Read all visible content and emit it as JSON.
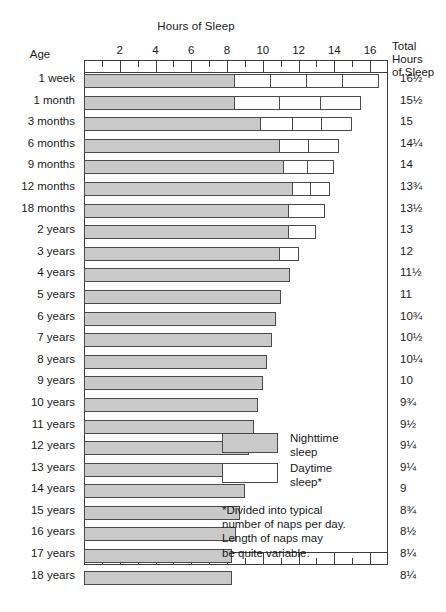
{
  "chart_data": {
    "type": "bar",
    "title": "Hours of Sleep",
    "subtitle": "",
    "xlabel": "Hours of Sleep",
    "ylabel": "Age",
    "orientation": "horizontal",
    "stacked": true,
    "xlim": [
      0,
      17
    ],
    "xticks_labeled": [
      2,
      4,
      6,
      8,
      10,
      12,
      14,
      16
    ],
    "xtick_labels": [
      "2",
      "4",
      "6",
      "8",
      "10",
      "12",
      "14",
      "16"
    ],
    "xticks_minor_step": 1,
    "bottom_xtick_labels": [
      "2",
      "4",
      "6",
      "8"
    ],
    "grid": false,
    "legend_position": "inside-lower-right",
    "series": [
      {
        "name": "Nighttime sleep",
        "color": "#c9c9c9"
      },
      {
        "name": "Daytime sleep*",
        "color": "#ffffff"
      }
    ],
    "categories": [
      "1 week",
      "1 month",
      "3 months",
      "6 months",
      "9 months",
      "12 months",
      "18 months",
      "2 years",
      "3 years",
      "4 years",
      "5 years",
      "6 years",
      "7 years",
      "8 years",
      "9 years",
      "10 years",
      "11 years",
      "12 years",
      "13 years",
      "14 years",
      "15 years",
      "16 years",
      "17 years",
      "18 years"
    ],
    "totals": [
      "16½",
      "15½",
      "15",
      "14¼",
      "14",
      "13¾",
      "13½",
      "13",
      "12",
      "11½",
      "11",
      "10¾",
      "10½",
      "10¼",
      "10",
      "9¾",
      "9½",
      "9¼",
      "9¼",
      "9",
      "8¾",
      "8½",
      "8¼",
      "8¼"
    ],
    "totals_numeric": [
      16.5,
      15.5,
      15,
      14.25,
      14,
      13.75,
      13.5,
      13,
      12,
      11.5,
      11,
      10.75,
      10.5,
      10.25,
      10,
      9.75,
      9.5,
      9.25,
      9.25,
      9,
      8.75,
      8.5,
      8.25,
      8.25
    ],
    "rows": [
      {
        "age": "1 week",
        "night": 8.5,
        "naps": [
          2.0,
          2.0,
          2.0,
          2.0
        ],
        "total": "16½"
      },
      {
        "age": "1 month",
        "night": 8.5,
        "naps": [
          2.5,
          2.25,
          2.25
        ],
        "total": "15½"
      },
      {
        "age": "3 months",
        "night": 10.0,
        "naps": [
          1.75,
          1.6,
          1.65
        ],
        "total": "15"
      },
      {
        "age": "6 months",
        "night": 11.0,
        "naps": [
          1.6,
          1.65
        ],
        "total": "14¼"
      },
      {
        "age": "9 months",
        "night": 11.25,
        "naps": [
          1.3,
          1.45
        ],
        "total": "14"
      },
      {
        "age": "12 months",
        "night": 11.75,
        "naps": [
          1.0,
          1.0
        ],
        "total": "13¾"
      },
      {
        "age": "18 months",
        "night": 11.5,
        "naps": [
          2.0
        ],
        "total": "13½"
      },
      {
        "age": "2 years",
        "night": 11.5,
        "naps": [
          1.5
        ],
        "total": "13"
      },
      {
        "age": "3 years",
        "night": 11.0,
        "naps": [
          1.0
        ],
        "total": "12"
      },
      {
        "age": "4 years",
        "night": 11.5,
        "naps": [],
        "total": "11½"
      },
      {
        "age": "5 years",
        "night": 11.0,
        "naps": [],
        "total": "11"
      },
      {
        "age": "6 years",
        "night": 10.75,
        "naps": [],
        "total": "10¾"
      },
      {
        "age": "7 years",
        "night": 10.5,
        "naps": [],
        "total": "10½"
      },
      {
        "age": "8 years",
        "night": 10.25,
        "naps": [],
        "total": "10¼"
      },
      {
        "age": "9 years",
        "night": 10.0,
        "naps": [],
        "total": "10"
      },
      {
        "age": "10 years",
        "night": 9.75,
        "naps": [],
        "total": "9¾"
      },
      {
        "age": "11 years",
        "night": 9.5,
        "naps": [],
        "total": "9½"
      },
      {
        "age": "12 years",
        "night": 9.25,
        "naps": [],
        "total": "9¼"
      },
      {
        "age": "13 years",
        "night": 9.25,
        "naps": [],
        "total": "9¼"
      },
      {
        "age": "14 years",
        "night": 9.0,
        "naps": [],
        "total": "9"
      },
      {
        "age": "15 years",
        "night": 8.75,
        "naps": [],
        "total": "8¾"
      },
      {
        "age": "16 years",
        "night": 8.5,
        "naps": [],
        "total": "8½"
      },
      {
        "age": "17 years",
        "night": 8.25,
        "naps": [],
        "total": "8¼"
      },
      {
        "age": "18 years",
        "night": 8.25,
        "naps": [],
        "total": "8¼"
      }
    ]
  },
  "headers": {
    "title": "Hours of Sleep",
    "age_label": "Age",
    "total_line1": "Total Hours",
    "total_line2": "of Sleep"
  },
  "legend": {
    "night_line1": "Nighttime",
    "night_line2": "sleep",
    "day_line1": "Daytime",
    "day_line2": "sleep*"
  },
  "footnote": {
    "line1": "*Divided into typical",
    "line2": "number of naps per day.",
    "line3": "Length of naps may",
    "line4": "be quite variable."
  },
  "colors": {
    "night": "#c9c9c9",
    "day": "#ffffff",
    "stroke": "#4a4a4a",
    "axis": "#3c3c3c",
    "text": "#1a1a1a"
  }
}
